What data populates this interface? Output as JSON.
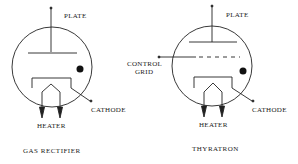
{
  "diagrams": [
    {
      "caption": "GAS RECTIFIER",
      "labels": {
        "plate": "PLATE",
        "cathode": "CATHODE",
        "heater": "HEATER"
      }
    },
    {
      "caption": "THYRATRON",
      "labels": {
        "plate": "PLATE",
        "control_grid_line1": "CONTROL",
        "control_grid_line2": "GRID",
        "cathode": "CATHODE",
        "heater": "HEATER"
      }
    }
  ],
  "colors": {
    "stroke": "#222222",
    "background": "#ffffff"
  }
}
